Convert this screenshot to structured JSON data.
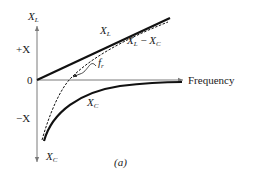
{
  "figure": {
    "caption": "(a)",
    "axes": {
      "y_label_top": "X",
      "y_label_top_sub": "L",
      "y_label_bottom": "X",
      "y_label_bottom_sub": "C",
      "x_label": "Frequency",
      "plus_tick": "+X",
      "zero_tick": "0",
      "minus_tick": "−X"
    },
    "curves": {
      "xl": {
        "label": "X",
        "sub": "L",
        "style": "solid-thick"
      },
      "xc": {
        "label": "X",
        "sub": "C",
        "style": "solid-thick"
      },
      "net": {
        "label_a": "X",
        "label_a_sub": "L",
        "label_op": " − ",
        "label_b": "X",
        "label_b_sub": "C",
        "style": "dashed"
      }
    },
    "annotation": {
      "label": "f",
      "sub": "r"
    },
    "colors": {
      "ink": "#1a1a1a",
      "axis": "#7a7a7a"
    }
  }
}
